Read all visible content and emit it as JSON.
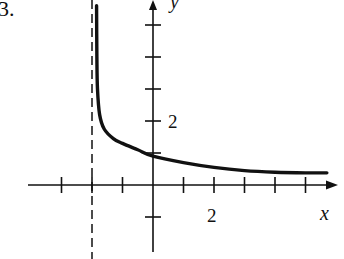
{
  "problem_label": "3.",
  "chart_data": {
    "type": "line",
    "title": "",
    "xlabel": "x",
    "ylabel": "y",
    "x_tick_label": "2",
    "y_tick_label": "2",
    "x_ticks": [
      -3,
      -2,
      -1,
      1,
      2,
      3,
      4,
      5
    ],
    "y_ticks": [
      -1,
      1,
      2,
      3,
      4,
      5
    ],
    "xlim": [
      -4,
      6
    ],
    "ylim": [
      -2,
      6
    ],
    "grid": false,
    "asymptotes": [
      {
        "type": "vertical",
        "x": -2,
        "style": "dashed"
      }
    ],
    "series": [
      {
        "name": "curve",
        "x": [
          -1.85,
          -1.84,
          -1.82,
          -1.75,
          -1.6,
          -1.3,
          -1.0,
          -0.5,
          0.0,
          1.0,
          2.0,
          3.0,
          4.0,
          5.0,
          5.7
        ],
        "y": [
          5.6,
          4.0,
          3.0,
          2.2,
          1.75,
          1.45,
          1.3,
          1.1,
          0.9,
          0.7,
          0.55,
          0.45,
          0.4,
          0.38,
          0.38
        ]
      }
    ]
  },
  "pixel_map": {
    "origin_x": 153,
    "origin_y": 185,
    "unit_x": 30.5,
    "unit_y": 32
  }
}
